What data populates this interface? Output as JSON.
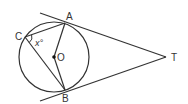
{
  "diagram": {
    "labels": {
      "A": "A",
      "B": "B",
      "C": "C",
      "O": "O",
      "T": "T",
      "angle": "x°"
    },
    "colors": {
      "line": "#333333",
      "background": "#ffffff"
    }
  }
}
